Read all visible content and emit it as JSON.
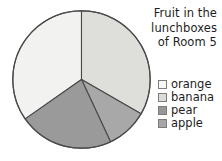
{
  "chart_data": {
    "type": "pie",
    "title": "Fruit in the lunchboxes of Room 5",
    "title_lines": [
      "Fruit in the",
      "lunchboxes",
      "of Room 5"
    ],
    "categories": [
      "orange",
      "banana",
      "pear",
      "apple"
    ],
    "values": [
      34.7,
      33.3,
      22.2,
      9.8
    ],
    "units": "percent",
    "legend_position": "right",
    "grid": false,
    "slices": [
      {
        "label": "orange",
        "percent": 34.7,
        "start_angle": 0,
        "end_angle": 125,
        "color": "#f2f2f0",
        "direction": "counterclockwise"
      },
      {
        "label": "banana",
        "percent": 33.3,
        "start_angle": 0,
        "end_angle": 120,
        "color": "#dededa",
        "direction": "clockwise"
      },
      {
        "label": "pear",
        "percent": 22.2,
        "start_angle": 125,
        "end_angle": 205,
        "color": "#9a9a9a",
        "direction": "counterclockwise"
      },
      {
        "label": "apple",
        "percent": 9.8,
        "start_angle": 120,
        "end_angle": 155,
        "color": "#a8a8a8",
        "direction": "clockwise"
      }
    ],
    "stroke_color": "#4a4a4a",
    "background": "#ffffff"
  },
  "legend": {
    "items": [
      {
        "label": "orange",
        "color": "#f7f7f5"
      },
      {
        "label": "banana",
        "color": "#dcdcd8"
      },
      {
        "label": "pear",
        "color": "#979797"
      },
      {
        "label": "apple",
        "color": "#a6a6a6"
      }
    ]
  }
}
